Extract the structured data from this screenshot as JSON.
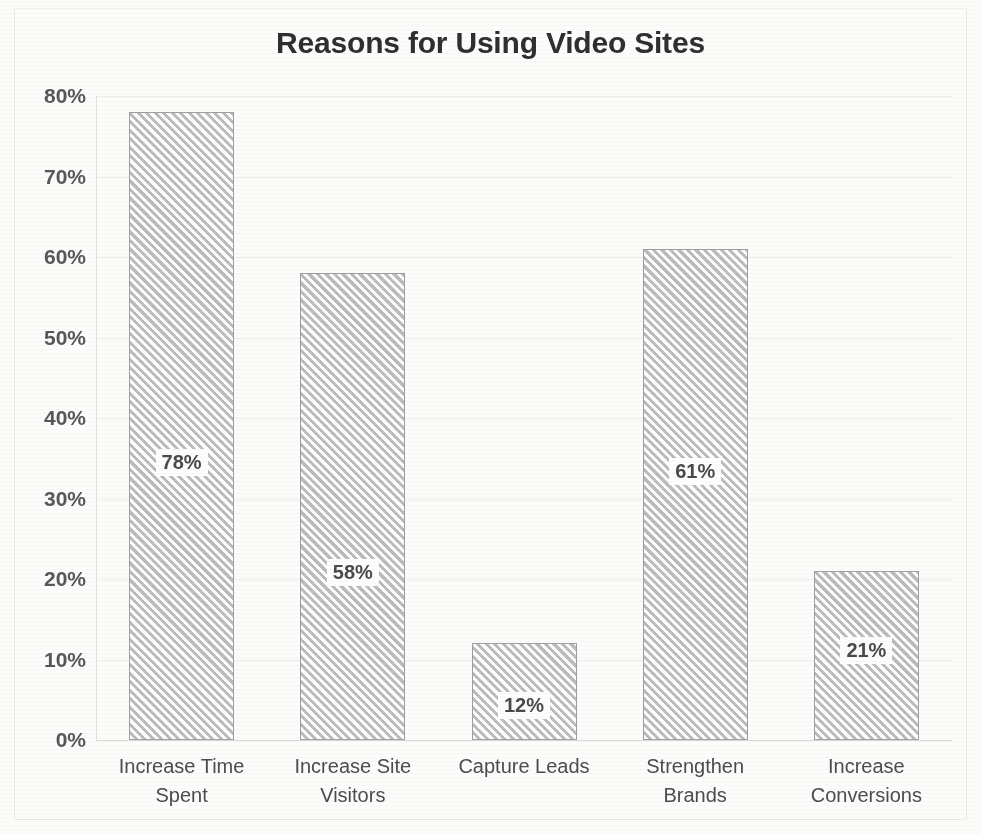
{
  "chart_data": {
    "type": "bar",
    "title": "Reasons for Using Video Sites",
    "xlabel": "",
    "ylabel": "",
    "categories": [
      "Increase Time Spent",
      "Increase Site Visitors",
      "Capture Leads",
      "Strengthen Brands",
      "Increase Conversions"
    ],
    "category_lines": [
      [
        "Increase Time",
        "Spent"
      ],
      [
        "Increase Site",
        "Visitors"
      ],
      [
        "Capture Leads",
        ""
      ],
      [
        "Strengthen",
        "Brands"
      ],
      [
        "Increase",
        "Conversions"
      ]
    ],
    "values": [
      78,
      58,
      12,
      61,
      21
    ],
    "data_labels": [
      "78%",
      "58%",
      "12%",
      "61%",
      "21%"
    ],
    "ylim": [
      0,
      80
    ],
    "ytick_values": [
      80,
      70,
      60,
      50,
      40,
      30,
      20,
      10,
      0
    ],
    "ytick_labels": [
      "80%",
      "70%",
      "60%",
      "50%",
      "40%",
      "30%",
      "20%",
      "10%",
      "0%"
    ],
    "grid": true,
    "legend": false,
    "bar_fill": "#dededd",
    "bar_edge": "#9e9e9e",
    "bar_pattern": "diagonal-hatch",
    "title_color": "#2f2f2f",
    "tick_color": "#585858",
    "grid_color": "#ededeb"
  }
}
